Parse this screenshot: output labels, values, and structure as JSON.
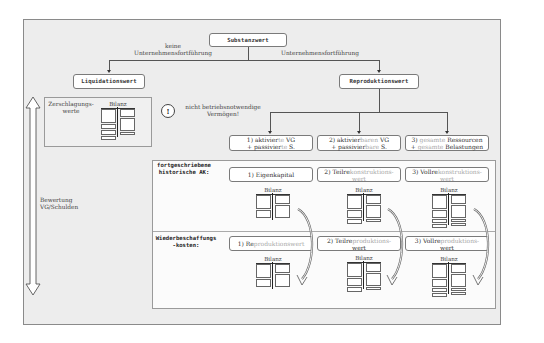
{
  "root": {
    "label": "Substanzwert"
  },
  "branches": {
    "left_label_line1": "keine",
    "left_label_line2": "Unternehmensfortführung",
    "right_label": "Unternehmensfortführung"
  },
  "liquidation": {
    "title": "Liquidationswert",
    "panel_label_line1": "Zerschlagungs-",
    "panel_label_line2": "werte",
    "bilanz": "Bilanz"
  },
  "note": {
    "icon": "exclamation-circle-icon",
    "line1": "nicht betriebsnotwendige",
    "line2": "Vermögen!"
  },
  "reproduction": {
    "title": "Reproduktionswert",
    "options": [
      {
        "l1a": "1) aktivier",
        "l1b": "te",
        "l1c": " VG",
        "l2a": "+ passivier",
        "l2b": "te",
        "l2c": " S."
      },
      {
        "l1a": "2) aktivier",
        "l1b": "baren",
        "l1c": " VG",
        "l2a": "+ passivier",
        "l2b": "bare",
        "l2c": " S."
      },
      {
        "l1a": "3) ",
        "l1b": "gesamte",
        "l1c": " Ressourcen",
        "l2a": "+ ",
        "l2b": "gesamte",
        "l2c": " Belastungen"
      }
    ]
  },
  "axis": {
    "line1": "Bewertung",
    "line2": "VG/Schulden"
  },
  "rows": [
    {
      "label_line1": "fortgeschriebene",
      "label_line2": "historische AK:",
      "boxes": [
        {
          "a": "1) Eigenkapital",
          "b": "",
          "c": ""
        },
        {
          "a": "2) Teilre",
          "b": "konstruktions-",
          "c": "wert"
        },
        {
          "a": "3) Vollre",
          "b": "konstruktions-",
          "c": "wert"
        }
      ]
    },
    {
      "label_line1": "Wiederbeschaffungs",
      "label_line2": "-kosten:",
      "boxes": [
        {
          "a": "1) Re",
          "b": "produktionswert",
          "c": ""
        },
        {
          "a": "2) Teilre",
          "b": "produktions-",
          "c": "wert"
        },
        {
          "a": "3) Vollre",
          "b": "produktions-",
          "c": "wert"
        }
      ]
    }
  ],
  "bilanz_label": "Bilanz"
}
